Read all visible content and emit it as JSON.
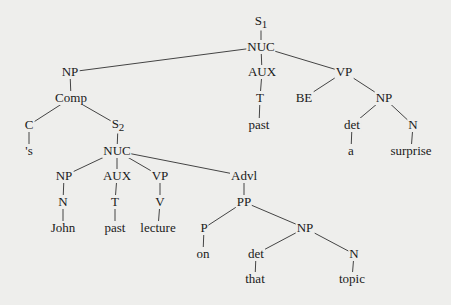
{
  "diagram": {
    "type": "syntax-tree",
    "nodes": [
      {
        "id": "s1",
        "label": "S",
        "sub": "1",
        "x": 261,
        "y": 22
      },
      {
        "id": "nuc1",
        "label": "NUC",
        "x": 261,
        "y": 47
      },
      {
        "id": "np1",
        "label": "NP",
        "x": 70,
        "y": 72
      },
      {
        "id": "aux1",
        "label": "AUX",
        "x": 262,
        "y": 72
      },
      {
        "id": "vp1",
        "label": "VP",
        "x": 344,
        "y": 72
      },
      {
        "id": "comp",
        "label": "Comp",
        "x": 71,
        "y": 98
      },
      {
        "id": "t1",
        "label": "T",
        "x": 260,
        "y": 98
      },
      {
        "id": "be",
        "label": "BE",
        "x": 304,
        "y": 98
      },
      {
        "id": "np2",
        "label": "NP",
        "x": 384,
        "y": 98
      },
      {
        "id": "c",
        "label": "C",
        "x": 29,
        "y": 125
      },
      {
        "id": "s2",
        "label": "S",
        "sub": "2",
        "x": 118,
        "y": 125
      },
      {
        "id": "past1",
        "label": "past",
        "x": 259,
        "y": 125
      },
      {
        "id": "det1",
        "label": "det",
        "x": 352,
        "y": 125
      },
      {
        "id": "n1",
        "label": "N",
        "x": 413,
        "y": 125
      },
      {
        "id": "poss",
        "label": "'s",
        "x": 29,
        "y": 151
      },
      {
        "id": "nuc2",
        "label": "NUC",
        "x": 117,
        "y": 151
      },
      {
        "id": "a",
        "label": "a",
        "x": 351,
        "y": 151
      },
      {
        "id": "surprise",
        "label": "surprise",
        "x": 411,
        "y": 151
      },
      {
        "id": "np3",
        "label": "NP",
        "x": 64,
        "y": 176
      },
      {
        "id": "aux2",
        "label": "AUX",
        "x": 117,
        "y": 176
      },
      {
        "id": "vp2",
        "label": "VP",
        "x": 160,
        "y": 176
      },
      {
        "id": "advl",
        "label": "Advl",
        "x": 244,
        "y": 176
      },
      {
        "id": "n2",
        "label": "N",
        "x": 63,
        "y": 202
      },
      {
        "id": "t2",
        "label": "T",
        "x": 115,
        "y": 202
      },
      {
        "id": "v",
        "label": "V",
        "x": 160,
        "y": 202
      },
      {
        "id": "pp",
        "label": "PP",
        "x": 244,
        "y": 202
      },
      {
        "id": "john",
        "label": "John",
        "x": 63,
        "y": 228
      },
      {
        "id": "past2",
        "label": "past",
        "x": 115,
        "y": 228
      },
      {
        "id": "lecture",
        "label": "lecture",
        "x": 158,
        "y": 228
      },
      {
        "id": "p",
        "label": "P",
        "x": 204,
        "y": 228
      },
      {
        "id": "np4",
        "label": "NP",
        "x": 305,
        "y": 228
      },
      {
        "id": "on",
        "label": "on",
        "x": 203,
        "y": 254
      },
      {
        "id": "det2",
        "label": "det",
        "x": 256,
        "y": 254
      },
      {
        "id": "n3",
        "label": "N",
        "x": 354,
        "y": 254
      },
      {
        "id": "that",
        "label": "that",
        "x": 255,
        "y": 279
      },
      {
        "id": "topic",
        "label": "topic",
        "x": 352,
        "y": 279
      }
    ],
    "edges": [
      [
        "s1",
        "nuc1"
      ],
      [
        "nuc1",
        "np1"
      ],
      [
        "nuc1",
        "aux1"
      ],
      [
        "nuc1",
        "vp1"
      ],
      [
        "np1",
        "comp"
      ],
      [
        "comp",
        "c"
      ],
      [
        "comp",
        "s2"
      ],
      [
        "c",
        "poss"
      ],
      [
        "s2",
        "nuc2"
      ],
      [
        "nuc2",
        "np3"
      ],
      [
        "nuc2",
        "aux2"
      ],
      [
        "nuc2",
        "vp2"
      ],
      [
        "nuc2",
        "advl"
      ],
      [
        "np3",
        "n2"
      ],
      [
        "n2",
        "john"
      ],
      [
        "aux2",
        "t2"
      ],
      [
        "t2",
        "past2"
      ],
      [
        "vp2",
        "v"
      ],
      [
        "v",
        "lecture"
      ],
      [
        "advl",
        "pp"
      ],
      [
        "pp",
        "p"
      ],
      [
        "pp",
        "np4"
      ],
      [
        "p",
        "on"
      ],
      [
        "np4",
        "det2"
      ],
      [
        "np4",
        "n3"
      ],
      [
        "det2",
        "that"
      ],
      [
        "n3",
        "topic"
      ],
      [
        "aux1",
        "t1"
      ],
      [
        "t1",
        "past1"
      ],
      [
        "vp1",
        "be"
      ],
      [
        "vp1",
        "np2"
      ],
      [
        "np2",
        "det1"
      ],
      [
        "np2",
        "n1"
      ],
      [
        "det1",
        "a"
      ],
      [
        "n1",
        "surprise"
      ]
    ]
  }
}
